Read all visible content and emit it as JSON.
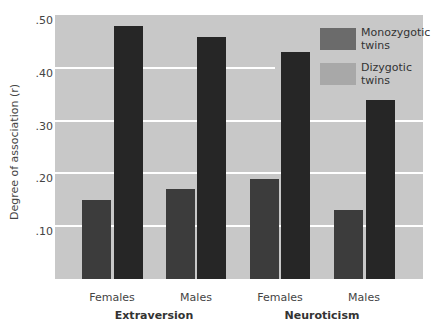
{
  "chart_data": {
    "type": "bar",
    "title": "",
    "xlabel": "",
    "ylabel": "Degree of association (r)",
    "ylim": [
      0,
      0.5
    ],
    "yticks": [
      ".10",
      ".20",
      ".30",
      ".40",
      ".50"
    ],
    "groups": [
      {
        "label": "Extraversion",
        "categories": [
          "Females",
          "Males"
        ]
      },
      {
        "label": "Neuroticism",
        "categories": [
          "Females",
          "Males"
        ]
      }
    ],
    "categories": [
      "Extraversion Females",
      "Extraversion Males",
      "Neuroticism Females",
      "Neuroticism Males"
    ],
    "series": [
      {
        "name": "Monozygotic twins",
        "values": [
          0.48,
          0.46,
          0.43,
          0.34
        ]
      },
      {
        "name": "Dizygotic twins",
        "values": [
          0.15,
          0.17,
          0.19,
          0.13
        ]
      }
    ],
    "grid": true,
    "legend_position": "upper right"
  },
  "axis": {
    "ylabel": "Degree of association (r)",
    "ticks": [
      {
        "label": ".50",
        "y": 15
      },
      {
        "label": ".40",
        "y": 68
      },
      {
        "label": ".30",
        "y": 121
      },
      {
        "label": ".20",
        "y": 173
      },
      {
        "label": ".10",
        "y": 226
      }
    ]
  },
  "xaxis": {
    "categories": [
      {
        "label": "Females",
        "x": 112
      },
      {
        "label": "Males",
        "x": 196
      },
      {
        "label": "Females",
        "x": 280
      },
      {
        "label": "Males",
        "x": 364
      }
    ],
    "groups": [
      {
        "label": "Extraversion",
        "x": 154
      },
      {
        "label": "Neuroticism",
        "x": 322
      }
    ]
  },
  "legend": {
    "items": [
      {
        "label_line1": "Monozygotic",
        "label_line2": "twins",
        "color": "#6b6b6b"
      },
      {
        "label_line1": "Dizygotic",
        "label_line2": "twins",
        "color": "#a8a8a8"
      }
    ]
  },
  "colors": {
    "plot_bg": "#c8c8c8",
    "grid": "#ffffff",
    "mz_bar": "#262626",
    "dz_bar": "#3c3c3c"
  }
}
